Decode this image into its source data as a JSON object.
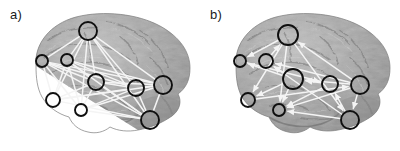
{
  "figure": {
    "caption_labels": {
      "panel_a": "a)",
      "panel_b": "b)"
    },
    "background_color": "#ffffff",
    "node_stroke_color": "#0f0f0f",
    "edge_color": "#f2f2f2",
    "brain_base_color": "#9a9a9a"
  },
  "panels": [
    {
      "id": "panel-a",
      "label": "a)",
      "graph_type": "undirected",
      "edge_style": "plain-line",
      "nodes": [
        {
          "id": "a1",
          "cx": 88,
          "cy": 31,
          "r": 9
        },
        {
          "id": "a2",
          "cx": 42,
          "cy": 61,
          "r": 6
        },
        {
          "id": "a3",
          "cx": 67,
          "cy": 60,
          "r": 6
        },
        {
          "id": "a4",
          "cx": 96,
          "cy": 82,
          "r": 8
        },
        {
          "id": "a5",
          "cx": 136,
          "cy": 88,
          "r": 8
        },
        {
          "id": "a6",
          "cx": 163,
          "cy": 85,
          "r": 9
        },
        {
          "id": "a7",
          "cx": 53,
          "cy": 100,
          "r": 7
        },
        {
          "id": "a8",
          "cx": 81,
          "cy": 110,
          "r": 6
        },
        {
          "id": "a9",
          "cx": 150,
          "cy": 120,
          "r": 9
        }
      ],
      "edges": [
        [
          "a1",
          "a2"
        ],
        [
          "a1",
          "a3"
        ],
        [
          "a1",
          "a4"
        ],
        [
          "a1",
          "a5"
        ],
        [
          "a1",
          "a6"
        ],
        [
          "a1",
          "a7"
        ],
        [
          "a1",
          "a8"
        ],
        [
          "a1",
          "a9"
        ],
        [
          "a2",
          "a4"
        ],
        [
          "a2",
          "a5"
        ],
        [
          "a2",
          "a6"
        ],
        [
          "a2",
          "a7"
        ],
        [
          "a2",
          "a9"
        ],
        [
          "a3",
          "a4"
        ],
        [
          "a3",
          "a5"
        ],
        [
          "a3",
          "a6"
        ],
        [
          "a3",
          "a7"
        ],
        [
          "a3",
          "a8"
        ],
        [
          "a4",
          "a5"
        ],
        [
          "a4",
          "a6"
        ],
        [
          "a4",
          "a7"
        ],
        [
          "a4",
          "a8"
        ],
        [
          "a4",
          "a9"
        ],
        [
          "a5",
          "a6"
        ],
        [
          "a5",
          "a7"
        ],
        [
          "a5",
          "a8"
        ],
        [
          "a5",
          "a9"
        ],
        [
          "a6",
          "a7"
        ],
        [
          "a6",
          "a8"
        ],
        [
          "a6",
          "a9"
        ],
        [
          "a7",
          "a9"
        ],
        [
          "a8",
          "a9"
        ],
        [
          "a2",
          "a8"
        ],
        [
          "a3",
          "a9"
        ]
      ]
    },
    {
      "id": "panel-b",
      "label": "b)",
      "graph_type": "directed",
      "edge_style": "arrow",
      "nodes": [
        {
          "id": "b1",
          "cx": 88,
          "cy": 35,
          "r": 10
        },
        {
          "id": "b2",
          "cx": 40,
          "cy": 61,
          "r": 6
        },
        {
          "id": "b3",
          "cx": 66,
          "cy": 61,
          "r": 7
        },
        {
          "id": "b4",
          "cx": 93,
          "cy": 79,
          "r": 10
        },
        {
          "id": "b5",
          "cx": 130,
          "cy": 84,
          "r": 8
        },
        {
          "id": "b6",
          "cx": 160,
          "cy": 85,
          "r": 9
        },
        {
          "id": "b7",
          "cx": 48,
          "cy": 100,
          "r": 7
        },
        {
          "id": "b8",
          "cx": 79,
          "cy": 110,
          "r": 6
        },
        {
          "id": "b9",
          "cx": 150,
          "cy": 120,
          "r": 9
        }
      ],
      "edges": [
        [
          "b1",
          "b2"
        ],
        [
          "b1",
          "b7"
        ],
        [
          "b1",
          "b8"
        ],
        [
          "b1",
          "b9"
        ],
        [
          "b3",
          "b1"
        ],
        [
          "b6",
          "b1"
        ],
        [
          "b4",
          "b2"
        ],
        [
          "b4",
          "b3"
        ],
        [
          "b4",
          "b7"
        ],
        [
          "b4",
          "b8"
        ],
        [
          "b5",
          "b4"
        ],
        [
          "b6",
          "b4"
        ],
        [
          "b6",
          "b3"
        ],
        [
          "b6",
          "b8"
        ],
        [
          "b9",
          "b5"
        ],
        [
          "b9",
          "b8"
        ],
        [
          "b9",
          "b3"
        ],
        [
          "b6",
          "b9"
        ],
        [
          "b5",
          "b8"
        ],
        [
          "b2",
          "b5"
        ],
        [
          "b7",
          "b6"
        ]
      ]
    }
  ]
}
